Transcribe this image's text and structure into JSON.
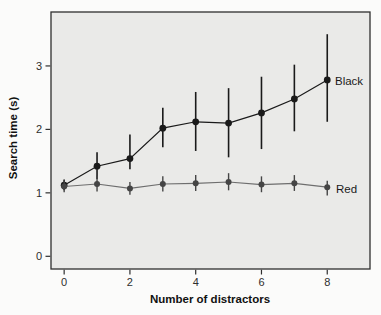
{
  "figure": {
    "background": "#fbfbfa",
    "plot_background": "#eaeae8",
    "frame_color": "#2f2f2f"
  },
  "chart_data": {
    "type": "line",
    "title": "",
    "xlabel": "Number of distractors",
    "ylabel": "Search time (s)",
    "x": [
      0,
      1,
      2,
      3,
      4,
      5,
      6,
      7,
      8
    ],
    "xlim": [
      -0.4,
      9.3
    ],
    "ylim": [
      -0.2,
      3.85
    ],
    "x_ticks": [
      0,
      2,
      4,
      6,
      8
    ],
    "y_ticks": [
      0,
      1,
      2,
      3
    ],
    "grid": false,
    "error_bars": true,
    "legend_position": "right-of-last-point",
    "series": [
      {
        "name": "Black",
        "color": "#1a1a1a",
        "line_color": "#1a1a1a",
        "marker": "circle",
        "values": [
          1.12,
          1.42,
          1.54,
          2.02,
          2.12,
          2.1,
          2.26,
          2.48,
          2.78
        ],
        "err_low": [
          1.04,
          1.22,
          1.37,
          1.72,
          1.66,
          1.56,
          1.69,
          1.97,
          2.12
        ],
        "err_high": [
          1.21,
          1.64,
          1.92,
          2.34,
          2.59,
          2.65,
          2.83,
          3.02,
          3.5
        ]
      },
      {
        "name": "Red",
        "color": "#454545",
        "line_color": "#6e6e6e",
        "marker": "circle",
        "values": [
          1.1,
          1.14,
          1.07,
          1.14,
          1.15,
          1.17,
          1.13,
          1.15,
          1.09
        ],
        "err_low": [
          1.01,
          1.02,
          0.97,
          1.02,
          1.03,
          1.04,
          1.01,
          1.03,
          0.96
        ],
        "err_high": [
          1.2,
          1.27,
          1.17,
          1.26,
          1.28,
          1.31,
          1.26,
          1.28,
          1.19
        ]
      }
    ]
  }
}
